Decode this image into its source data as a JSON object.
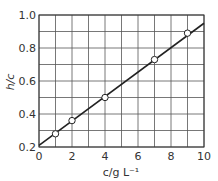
{
  "chart_data": {
    "type": "scatter",
    "title": "",
    "xlabel": "c/g L⁻¹",
    "ylabel": "h/c",
    "xlim": [
      0,
      10
    ],
    "ylim": [
      0.2,
      1.0
    ],
    "grid": true,
    "x_ticks": [
      0,
      2,
      4,
      6,
      8,
      10
    ],
    "y_ticks": [
      0.2,
      0.4,
      0.6,
      0.8,
      1.0
    ],
    "x_tick_labels": [
      "0",
      "2",
      "4",
      "6",
      "8",
      "10"
    ],
    "y_tick_labels": [
      "0.2",
      "0.4",
      "0.6",
      "0.8",
      "1.0"
    ],
    "series": [
      {
        "name": "data",
        "marker": "open-circle",
        "x": [
          1,
          2,
          4,
          7,
          9
        ],
        "y": [
          0.28,
          0.36,
          0.5,
          0.73,
          0.89
        ]
      },
      {
        "name": "fit",
        "style": "line",
        "x": [
          0,
          10
        ],
        "y": [
          0.21,
          0.95
        ]
      }
    ],
    "legend": null
  },
  "colors": {
    "grid": "#555555",
    "line": "#222222",
    "marker_fill": "#ffffff",
    "text": "#333333"
  }
}
